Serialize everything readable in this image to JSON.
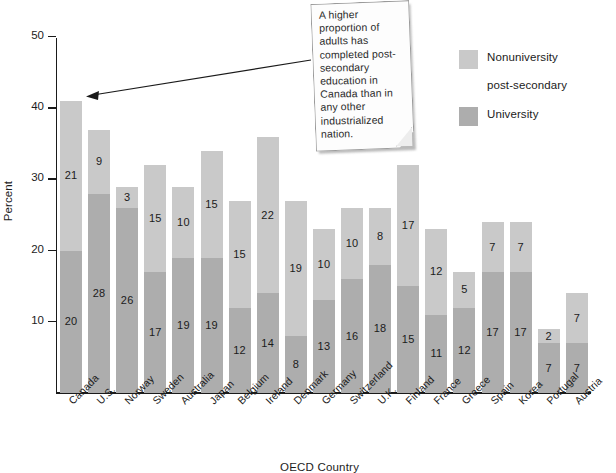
{
  "chart_data": {
    "type": "bar",
    "subtype": "stacked",
    "title": "",
    "xlabel": "OECD Country",
    "ylabel": "Percent",
    "ylim": [
      0,
      50
    ],
    "yticks": [
      10,
      20,
      30,
      40,
      50
    ],
    "grid": false,
    "legend_position": "upper-right",
    "categories": [
      "Canada",
      "U.S.",
      "Norway",
      "Sweden",
      "Australia",
      "Japan",
      "Belgium",
      "Ireland",
      "Denmark",
      "Germany",
      "Switzerland",
      "U.K.",
      "Finland",
      "France",
      "Greece",
      "Spain",
      "Korea",
      "Portugal",
      "Austria"
    ],
    "series": [
      {
        "name": "University",
        "color": "#adadad",
        "values": [
          20,
          28,
          26,
          17,
          19,
          19,
          12,
          14,
          8,
          13,
          16,
          18,
          15,
          11,
          12,
          17,
          17,
          7,
          7
        ]
      },
      {
        "name": "Nonuniversity post-secondary",
        "color": "#c9c9c9",
        "values": [
          21,
          9,
          3,
          15,
          10,
          15,
          15,
          22,
          19,
          10,
          10,
          8,
          17,
          12,
          5,
          7,
          7,
          2,
          7
        ]
      }
    ],
    "totals": [
      41,
      37,
      29,
      32,
      29,
      34,
      27,
      36,
      27,
      23,
      26,
      26,
      32,
      23,
      17,
      24,
      24,
      9,
      14
    ]
  },
  "legend": {
    "items": [
      {
        "label_line1": "Nonuniversity",
        "label_line2": "post-secondary",
        "color": "#c9c9c9"
      },
      {
        "label_line1": "University",
        "label_line2": "",
        "color": "#adadad"
      }
    ]
  },
  "annotation": {
    "text": "A higher proportion of adults has completed post-secondary education in Canada than in any other industrialized nation.",
    "points_to": "Canada"
  }
}
